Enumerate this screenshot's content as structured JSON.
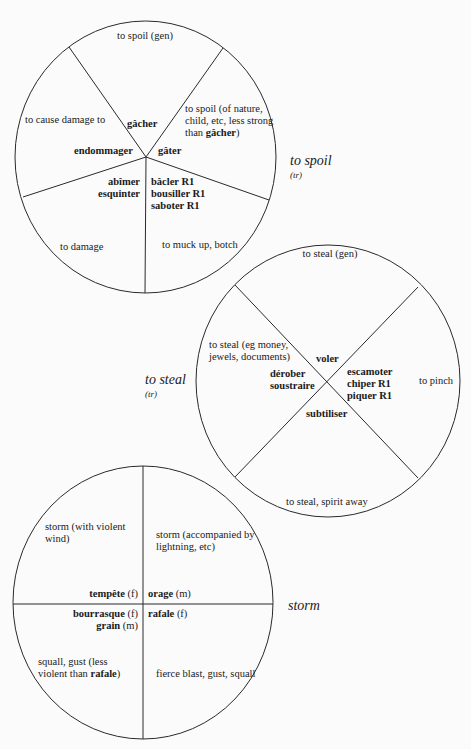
{
  "diagrams": {
    "spoil": {
      "title": "to spoil",
      "grammar": "(tr)",
      "sectors": {
        "top": "to spoil (gen)",
        "upper_left": "to cause damage to",
        "upper_right_line1": "to spoil (of nature,",
        "upper_right_line2": "child, etc, less strong",
        "upper_right_line3_prefix": "than ",
        "upper_right_line3_bold": "gâcher",
        "upper_right_line3_suffix": ")",
        "lower_left": "to damage",
        "lower_right": "to muck up, botch"
      },
      "words": {
        "top": "gâcher",
        "left": "endommager",
        "right": "gâter",
        "lower_left_1": "abîmer",
        "lower_left_2": "esquinter",
        "lower_right_1": "bâcler R1",
        "lower_right_2": "bousiller R1",
        "lower_right_3": "saboter R1"
      }
    },
    "steal": {
      "title": "to steal",
      "grammar": "(tr)",
      "sectors": {
        "top": "to steal (gen)",
        "left_line1": "to steal (eg money,",
        "left_line2": "jewels, documents)",
        "right": "to pinch",
        "bottom": "to steal, spirit away"
      },
      "words": {
        "top": "voler",
        "left_1": "dérober",
        "left_2": "soustraire",
        "right_1": "escamoter",
        "right_2": "chiper R1",
        "right_3": "piquer R1",
        "bottom": "subtiliser"
      }
    },
    "storm": {
      "title": "storm",
      "sectors": {
        "upper_left_line1": "storm (with violent",
        "upper_left_line2": "wind)",
        "upper_right_line1": "storm (accompanied by",
        "upper_right_line2": "lightning, etc)",
        "lower_left_line1": "squall, gust (less",
        "lower_left_line2_prefix": "violent than ",
        "lower_left_line2_bold": "rafale",
        "lower_left_line2_suffix": ")",
        "lower_right": "fierce blast, gust, squall"
      },
      "words": {
        "upper_left_word": "tempête",
        "upper_left_gender": " (f)",
        "upper_right_word": "orage",
        "upper_right_gender": " (m)",
        "lower_left_1_word": "bourrasque",
        "lower_left_1_gender": " (f)",
        "lower_left_2_word": "grain",
        "lower_left_2_gender": " (m)",
        "lower_right_word": "rafale",
        "lower_right_gender": " (f)"
      }
    }
  },
  "colors": {
    "line": "#2a2a2a",
    "background": "#fbfbfb",
    "text": "#1a1a1a"
  }
}
